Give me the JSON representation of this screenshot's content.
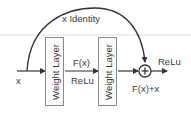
{
  "diagram": {
    "type": "residual-block",
    "input_label": "x",
    "skip_connection_label": "x Identity",
    "layers": [
      {
        "label": "Weight Layer"
      },
      {
        "label": "Weight Layer"
      }
    ],
    "intermediate": {
      "top_label": "F(x)",
      "bottom_label": "ReLu"
    },
    "sum_node": {
      "symbol": "+",
      "label": "F(x)+x"
    },
    "output_activation": "ReLu"
  },
  "colors": {
    "stroke": "#333333",
    "box_border": "#8a8a8a",
    "text": "#3a3a3a",
    "guide_line": "#d9d9d9"
  }
}
